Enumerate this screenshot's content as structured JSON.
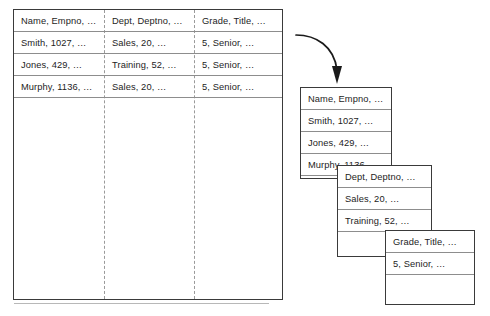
{
  "diagram": {
    "source_table": {
      "columns": [
        "Name, Empno, …",
        "Dept, Deptno, …",
        "Grade, Title, …"
      ],
      "rows": [
        [
          "Name, Empno, …",
          "Dept, Deptno, …",
          "Grade, Title, …"
        ],
        [
          "Smith, 1027, …",
          "Sales, 20, …",
          "5, Senior, …"
        ],
        [
          "Jones, 429, …",
          "Training, 52, …",
          "5, Senior, …"
        ],
        [
          "Murphy, 1136, …",
          "Sales, 20, …",
          "5, Senior, …"
        ]
      ]
    },
    "arrow": {
      "name": "transform-arrow",
      "color": "#1a1a1a"
    },
    "column_boxes": [
      {
        "name": "name-column-box",
        "rows": [
          "Name, Empno, …",
          "Smith, 1027, …",
          "Jones, 429, …",
          "Murphy, 1136, …"
        ]
      },
      {
        "name": "dept-column-box",
        "rows": [
          "Dept, Deptno, …",
          "Sales, 20, …",
          "Training, 52, …"
        ]
      },
      {
        "name": "grade-column-box",
        "rows": [
          "Grade, Title, …",
          "5, Senior, …"
        ]
      }
    ]
  },
  "colors": {
    "border": "#3a3a3a",
    "rule": "#8d8d8d",
    "dashed_divider": "#9a9a9a",
    "text": "#1d1d1d",
    "background": "#ffffff"
  }
}
